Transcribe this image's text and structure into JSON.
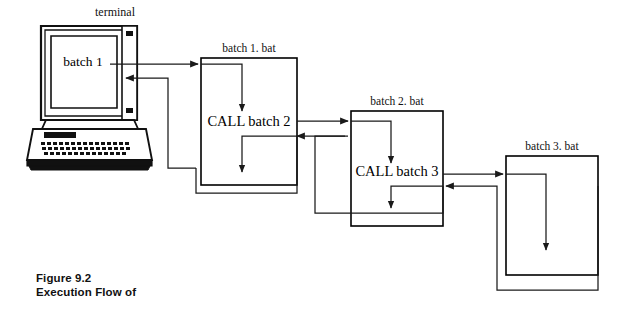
{
  "figure": {
    "caption_line1": "Figure 9.2",
    "caption_line2": "Execution Flow of"
  },
  "terminal": {
    "label": "terminal",
    "screen_text": "batch 1",
    "icon": "desktop-computer-icon"
  },
  "boxes": [
    {
      "id": "batch1",
      "title": "batch 1. bat",
      "body": "CALL batch 2",
      "x": 201,
      "y": 58,
      "width": 96,
      "height": 127
    },
    {
      "id": "batch2",
      "title": "batch 2. bat",
      "body": "CALL batch 3",
      "x": 351,
      "y": 111,
      "width": 92,
      "height": 115
    },
    {
      "id": "batch3",
      "title": "batch 3. bat",
      "body": "",
      "x": 506,
      "y": 156,
      "width": 92,
      "height": 119
    }
  ],
  "flows": [
    {
      "id": "terminal-to-batch1",
      "from": "terminal",
      "to": "batch 1. bat",
      "direction": "right"
    },
    {
      "id": "batch1-to-terminal",
      "from": "batch 1. bat",
      "to": "terminal",
      "direction": "left"
    },
    {
      "id": "batch1-internal-entry",
      "from": "box-top",
      "to": "CALL batch 2",
      "direction": "down"
    },
    {
      "id": "batch1-internal-return",
      "from": "return-path",
      "to": "box-bottom",
      "direction": "down"
    },
    {
      "id": "batch1-to-batch2",
      "from": "CALL batch 2",
      "to": "batch 2. bat",
      "direction": "right"
    },
    {
      "id": "batch2-to-batch1",
      "from": "batch 2. bat",
      "to": "batch 1. bat",
      "direction": "left"
    },
    {
      "id": "batch2-internal-entry",
      "from": "box-top",
      "to": "CALL batch 3",
      "direction": "down"
    },
    {
      "id": "batch2-internal-return",
      "from": "return-path",
      "to": "box-bottom",
      "direction": "down"
    },
    {
      "id": "batch2-to-batch3",
      "from": "CALL batch 3",
      "to": "batch 3. bat",
      "direction": "right"
    },
    {
      "id": "batch3-to-batch2",
      "from": "batch 3. bat",
      "to": "batch 2. bat",
      "direction": "left"
    },
    {
      "id": "batch3-internal",
      "from": "box-top",
      "to": "box-bottom",
      "direction": "down"
    }
  ],
  "colors": {
    "ink": "#000000",
    "line": "#1a1a1a",
    "background": "#ffffff"
  }
}
